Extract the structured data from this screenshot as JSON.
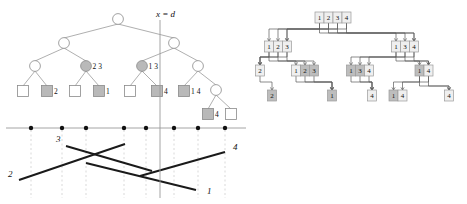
{
  "figure": {
    "caption_label": "",
    "panels": [
      "range-tree-panel",
      "fractional-cascading-panel"
    ]
  },
  "colors": {
    "line": "#000000",
    "thin_line": "#888888",
    "node_stroke": "#8a8a8a",
    "node_fill_empty": "#ffffff",
    "node_fill_shaded": "#b9b9b9",
    "axis": "#9a9a9a",
    "dot": "#111111",
    "dashed_guide": "#cfcfcf",
    "segment": "#1a1a1a",
    "cascade_stroke": "#9a9a9a",
    "cascade_fill": "#efefef",
    "cascade_fill_shaded": "#bdbdbd",
    "cascade_pointer": "#5a5a5a"
  },
  "left_panel": {
    "name": "range-tree-with-split-line",
    "split_line_label": "x = d",
    "split_line_x": 186,
    "tree": {
      "levels": [
        {
          "level": 0,
          "nodes": [
            {
              "id": "root",
              "x": 118,
              "y": 19,
              "shaded": false,
              "label": ""
            }
          ]
        },
        {
          "level": 1,
          "nodes": [
            {
              "id": "n1",
              "x": 64,
              "y": 43,
              "shaded": false,
              "label": ""
            },
            {
              "id": "n2",
              "x": 174,
              "y": 43,
              "shaded": false,
              "label": ""
            }
          ]
        },
        {
          "level": 2,
          "nodes": [
            {
              "id": "n3",
              "x": 35,
              "y": 66,
              "shaded": false,
              "label": ""
            },
            {
              "id": "n4",
              "x": 86,
              "y": 66,
              "shaded": true,
              "label": "2 3"
            },
            {
              "id": "n5",
              "x": 142,
              "y": 66,
              "shaded": true,
              "label": "1 3"
            },
            {
              "id": "n6",
              "x": 198,
              "y": 66,
              "shaded": false,
              "label": ""
            }
          ]
        },
        {
          "level": 3,
          "nodes": [
            {
              "id": "n7",
              "x": 216,
              "y": 90,
              "shaded": false,
              "label": "",
              "shape": "circle"
            }
          ]
        }
      ],
      "leaves": [
        {
          "id": "l1",
          "x": 23,
          "y": 91,
          "shaded": false,
          "label": ""
        },
        {
          "id": "l2",
          "x": 47,
          "y": 91,
          "shaded": true,
          "label": "2"
        },
        {
          "id": "l3",
          "x": 75,
          "y": 91,
          "shaded": false,
          "label": ""
        },
        {
          "id": "l4",
          "x": 99,
          "y": 91,
          "shaded": true,
          "label": "1"
        },
        {
          "id": "l5",
          "x": 130,
          "y": 91,
          "shaded": false,
          "label": ""
        },
        {
          "id": "l6",
          "x": 157,
          "y": 91,
          "shaded": true,
          "label": "4"
        },
        {
          "id": "l7",
          "x": 184,
          "y": 91,
          "shaded": true,
          "label": "1 4"
        },
        {
          "id": "l8",
          "x": 208,
          "y": 114,
          "shaded": true,
          "label": "4"
        },
        {
          "id": "l9",
          "x": 231,
          "y": 114,
          "shaded": false,
          "label": ""
        }
      ],
      "edges": [
        [
          "root",
          "n1"
        ],
        [
          "root",
          "n2"
        ],
        [
          "n1",
          "n3"
        ],
        [
          "n1",
          "n4"
        ],
        [
          "n2",
          "n5"
        ],
        [
          "n2",
          "n6"
        ],
        [
          "n3",
          "l1"
        ],
        [
          "n3",
          "l2"
        ],
        [
          "n4",
          "l3"
        ],
        [
          "n4",
          "l4"
        ],
        [
          "n5",
          "l5"
        ],
        [
          "n5",
          "l6"
        ],
        [
          "n6",
          "l7"
        ],
        [
          "n6",
          "n7"
        ],
        [
          "n7",
          "l8"
        ],
        [
          "n7",
          "l9"
        ]
      ]
    },
    "axis": {
      "y": 128,
      "x_start": 6,
      "x_end": 246,
      "dots_x": [
        31,
        62,
        86,
        124,
        146,
        174,
        198,
        225
      ]
    },
    "segments": [
      {
        "label": "3",
        "label_x": 56,
        "label_y": 142,
        "x1": 66,
        "y1": 146,
        "x2": 152,
        "y2": 171
      },
      {
        "label": "2",
        "label_x": 8,
        "label_y": 177,
        "x1": 19,
        "y1": 180,
        "x2": 125,
        "y2": 144
      },
      {
        "label": "4",
        "label_x": 233,
        "label_y": 150,
        "x1": 225,
        "y1": 152,
        "x2": 140,
        "y2": 176
      },
      {
        "label": "1",
        "label_x": 207,
        "label_y": 194,
        "x1": 196,
        "y1": 190,
        "x2": 86,
        "y2": 163
      }
    ]
  },
  "right_panel": {
    "name": "fractional-cascading-structure",
    "nodes": [
      {
        "id": "r-root",
        "x": 333,
        "y": 12,
        "cells": [
          {
            "v": "1",
            "shaded": false
          },
          {
            "v": "2",
            "shaded": false
          },
          {
            "v": "3",
            "shaded": false
          },
          {
            "v": "4",
            "shaded": false
          }
        ]
      },
      {
        "id": "r-L1",
        "x": 278,
        "y": 41,
        "cells": [
          {
            "v": "1",
            "shaded": false
          },
          {
            "v": "2",
            "shaded": false
          },
          {
            "v": "3",
            "shaded": false
          }
        ]
      },
      {
        "id": "r-R1",
        "x": 405,
        "y": 41,
        "cells": [
          {
            "v": "1",
            "shaded": false
          },
          {
            "v": "3",
            "shaded": false
          },
          {
            "v": "4",
            "shaded": false
          }
        ]
      },
      {
        "id": "r-LL2",
        "x": 260,
        "y": 65,
        "cells": [
          {
            "v": "2",
            "shaded": false
          }
        ]
      },
      {
        "id": "r-LR2",
        "x": 305,
        "y": 65,
        "cells": [
          {
            "v": "1",
            "shaded": false
          },
          {
            "v": "2",
            "shaded": true
          },
          {
            "v": "3",
            "shaded": true
          }
        ]
      },
      {
        "id": "r-RL2",
        "x": 360,
        "y": 65,
        "cells": [
          {
            "v": "1",
            "shaded": true
          },
          {
            "v": "3",
            "shaded": true
          },
          {
            "v": "4",
            "shaded": false
          }
        ]
      },
      {
        "id": "r-RR2",
        "x": 424,
        "y": 65,
        "cells": [
          {
            "v": "1",
            "shaded": true
          },
          {
            "v": "4",
            "shaded": false
          }
        ]
      },
      {
        "id": "r-b1",
        "x": 272,
        "y": 90,
        "cells": [
          {
            "v": "2",
            "shaded": true
          }
        ]
      },
      {
        "id": "r-b2",
        "x": 332,
        "y": 90,
        "cells": [
          {
            "v": "1",
            "shaded": true
          }
        ]
      },
      {
        "id": "r-b3",
        "x": 372,
        "y": 90,
        "cells": [
          {
            "v": "4",
            "shaded": false
          }
        ]
      },
      {
        "id": "r-b4",
        "x": 398,
        "y": 90,
        "cells": [
          {
            "v": "1",
            "shaded": true
          },
          {
            "v": "4",
            "shaded": false
          }
        ]
      },
      {
        "id": "r-b5",
        "x": 449,
        "y": 90,
        "cells": [
          {
            "v": "4",
            "shaded": false
          }
        ]
      }
    ]
  }
}
